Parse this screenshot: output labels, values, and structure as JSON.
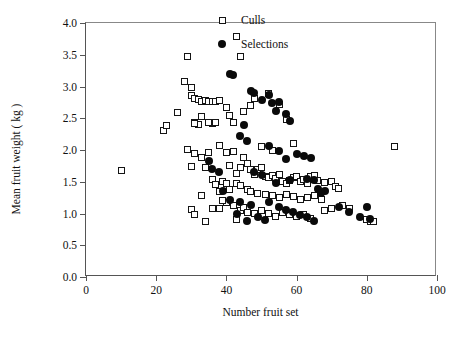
{
  "chart_data": {
    "type": "scatter",
    "title": "",
    "xlabel": "Number fruit set",
    "ylabel": "Mean fruit weight ( kg )",
    "xlim": [
      0,
      100
    ],
    "ylim": [
      0,
      4.0
    ],
    "xticks": [
      0,
      20,
      40,
      60,
      80,
      100
    ],
    "yticks": [
      "0.0",
      "0.5",
      "1.0",
      "1.5",
      "2.0",
      "2.5",
      "3.0",
      "3.5",
      "4.0"
    ],
    "grid": false,
    "legend_position": "top-right",
    "series": [
      {
        "name": "Culls",
        "marker": "open-square",
        "color": "#141414",
        "points": [
          [
            10,
            1.68
          ],
          [
            22,
            2.3
          ],
          [
            23,
            2.38
          ],
          [
            26,
            2.59
          ],
          [
            29,
            3.48
          ],
          [
            28,
            3.08
          ],
          [
            30,
            2.99
          ],
          [
            30,
            2.86
          ],
          [
            31,
            2.81
          ],
          [
            32,
            2.79
          ],
          [
            33,
            2.77
          ],
          [
            34,
            2.78
          ],
          [
            35,
            2.77
          ],
          [
            36,
            2.77
          ],
          [
            37,
            2.76
          ],
          [
            38,
            2.78
          ],
          [
            31,
            2.44
          ],
          [
            32,
            2.4
          ],
          [
            33,
            2.52
          ],
          [
            36,
            2.42
          ],
          [
            37,
            2.43
          ],
          [
            41,
            2.55
          ],
          [
            42,
            2.44
          ],
          [
            44,
            3.48
          ],
          [
            43,
            3.78
          ],
          [
            40,
            2.67
          ],
          [
            47,
            2.7
          ],
          [
            48,
            2.81
          ],
          [
            52,
            2.89
          ],
          [
            55,
            2.72
          ],
          [
            57,
            2.48
          ],
          [
            45,
            2.6
          ],
          [
            29,
            2.01
          ],
          [
            31,
            1.95
          ],
          [
            33,
            1.88
          ],
          [
            34,
            1.72
          ],
          [
            30,
            1.74
          ],
          [
            35,
            1.96
          ],
          [
            38,
            2.07
          ],
          [
            40,
            1.96
          ],
          [
            42,
            1.98
          ],
          [
            41,
            1.75
          ],
          [
            43,
            1.63
          ],
          [
            44,
            1.72
          ],
          [
            45,
            1.88
          ],
          [
            46,
            1.78
          ],
          [
            47,
            1.69
          ],
          [
            48,
            1.62
          ],
          [
            49,
            1.7
          ],
          [
            50,
            1.73
          ],
          [
            51,
            1.58
          ],
          [
            52,
            1.57
          ],
          [
            53,
            1.6
          ],
          [
            54,
            1.55
          ],
          [
            55,
            1.62
          ],
          [
            56,
            1.5
          ],
          [
            57,
            1.47
          ],
          [
            58,
            1.52
          ],
          [
            59,
            1.56
          ],
          [
            60,
            1.58
          ],
          [
            61,
            1.5
          ],
          [
            62,
            1.53
          ],
          [
            63,
            1.47
          ],
          [
            64,
            1.58
          ],
          [
            65,
            1.6
          ],
          [
            66,
            1.52
          ],
          [
            68,
            1.49
          ],
          [
            70,
            1.51
          ],
          [
            71,
            1.43
          ],
          [
            72,
            1.4
          ],
          [
            36,
            1.53
          ],
          [
            37,
            1.45
          ],
          [
            39,
            1.5
          ],
          [
            40,
            1.48
          ],
          [
            43,
            1.47
          ],
          [
            44,
            1.44
          ],
          [
            38,
            1.34
          ],
          [
            41,
            1.38
          ],
          [
            46,
            1.38
          ],
          [
            47,
            1.35
          ],
          [
            49,
            1.32
          ],
          [
            51,
            1.3
          ],
          [
            53,
            1.28
          ],
          [
            55,
            1.25
          ],
          [
            57,
            1.3
          ],
          [
            59,
            1.27
          ],
          [
            61,
            1.22
          ],
          [
            63,
            1.25
          ],
          [
            65,
            1.28
          ],
          [
            67,
            1.22
          ],
          [
            30,
            1.06
          ],
          [
            31,
            0.99
          ],
          [
            34,
            0.87
          ],
          [
            33,
            1.28
          ],
          [
            36,
            1.08
          ],
          [
            38,
            1.08
          ],
          [
            40,
            1.18
          ],
          [
            42,
            1.12
          ],
          [
            44,
            1.05
          ],
          [
            45,
            1.1
          ],
          [
            46,
            1.02
          ],
          [
            48,
            1.0
          ],
          [
            50,
            1.05
          ],
          [
            52,
            1.0
          ],
          [
            54,
            0.96
          ],
          [
            56,
            1.02
          ],
          [
            58,
            0.98
          ],
          [
            60,
            0.95
          ],
          [
            62,
            0.98
          ],
          [
            64,
            0.92
          ],
          [
            68,
            1.05
          ],
          [
            70,
            1.08
          ],
          [
            73,
            1.12
          ],
          [
            75,
            1.08
          ],
          [
            80,
            0.9
          ],
          [
            81,
            0.87
          ],
          [
            82,
            0.88
          ],
          [
            88,
            2.06
          ],
          [
            59,
            2.11
          ],
          [
            50,
            2.06
          ],
          [
            53,
            1.99
          ],
          [
            31,
            2.42
          ],
          [
            35,
            2.43
          ],
          [
            39,
            1.2
          ],
          [
            43,
            0.9
          ]
        ]
      },
      {
        "name": "Selections",
        "marker": "filled-circle",
        "color": "#0a0a0a",
        "points": [
          [
            41,
            3.2
          ],
          [
            42,
            3.18
          ],
          [
            47,
            2.93
          ],
          [
            48,
            2.89
          ],
          [
            50,
            2.78
          ],
          [
            52,
            2.86
          ],
          [
            53,
            2.74
          ],
          [
            55,
            2.76
          ],
          [
            54,
            2.62
          ],
          [
            57,
            2.56
          ],
          [
            58,
            2.46
          ],
          [
            45,
            2.4
          ],
          [
            44,
            2.22
          ],
          [
            46,
            2.14
          ],
          [
            52,
            2.07
          ],
          [
            55,
            1.98
          ],
          [
            57,
            1.86
          ],
          [
            60,
            1.93
          ],
          [
            62,
            1.9
          ],
          [
            64,
            1.88
          ],
          [
            35,
            1.82
          ],
          [
            36,
            1.7
          ],
          [
            38,
            1.65
          ],
          [
            48,
            1.66
          ],
          [
            50,
            1.6
          ],
          [
            54,
            1.48
          ],
          [
            58,
            1.52
          ],
          [
            63,
            1.54
          ],
          [
            65,
            1.52
          ],
          [
            66,
            1.38
          ],
          [
            68,
            1.35
          ],
          [
            41,
            1.22
          ],
          [
            44,
            1.18
          ],
          [
            47,
            1.14
          ],
          [
            52,
            1.18
          ],
          [
            55,
            1.1
          ],
          [
            57,
            1.06
          ],
          [
            59,
            1.02
          ],
          [
            61,
            0.98
          ],
          [
            63,
            0.94
          ],
          [
            65,
            0.88
          ],
          [
            49,
            0.95
          ],
          [
            51,
            0.9
          ],
          [
            72,
            1.1
          ],
          [
            75,
            1.02
          ],
          [
            78,
            0.95
          ],
          [
            80,
            1.1
          ],
          [
            81,
            0.92
          ],
          [
            43,
            1.0
          ],
          [
            46,
            0.88
          ],
          [
            67,
            1.32
          ],
          [
            39,
            1.36
          ]
        ]
      }
    ]
  },
  "legend": {
    "entries": [
      {
        "label": "Culls",
        "symbol": "open-square-icon"
      },
      {
        "label": "Selections",
        "symbol": "filled-circle-icon"
      }
    ]
  }
}
